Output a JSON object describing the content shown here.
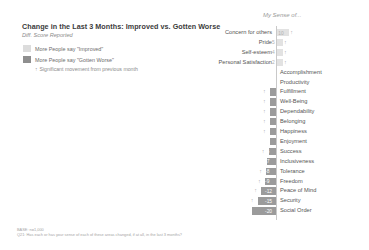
{
  "header": {
    "title": "Change in the Last 3 Months: Improved vs. Gotten Worse",
    "subtitle": "Diff. Score Reported",
    "plot_header": "My Sense of..."
  },
  "legend": {
    "items": [
      {
        "swatch": "light",
        "label": "More People say \"Improved\""
      },
      {
        "swatch": "dark",
        "label": "More People say \"Gotten Worse\""
      }
    ],
    "note": "Significant movement from previous month",
    "note_marker": "↑"
  },
  "footnote": {
    "line1": "BASE: n=1,000",
    "line2": "Q21: Has each or has your sense of each of these areas changed, if at all, in the last 3 months?"
  },
  "colors": {
    "improved": "#e2e2e2",
    "worse": "#9b9b9b",
    "axis": "#c9c9c9",
    "text": "#555555",
    "muted": "#9a9a9a"
  },
  "chart_data": {
    "type": "bar",
    "orientation": "horizontal",
    "title": "Change in the Last 3 Months: Improved vs. Gotten Worse",
    "subtitle": "Diff. Score Reported",
    "xlabel": "",
    "ylabel": "My Sense of...",
    "xlim": [
      -30,
      12
    ],
    "grid": false,
    "legend_position": "top-left",
    "categories": [
      "Concern for others",
      "Pride",
      "Self-esteem",
      "Personal Satisfaction",
      "Accomplishment",
      "Productivity",
      "Fulfillment",
      "Well-Being",
      "Dependability",
      "Belonging",
      "Happiness",
      "Enjoyment",
      "Success",
      "Inclusiveness",
      "Tolerance",
      "Freedom",
      "Peace of Mind",
      "Security",
      "Social Order"
    ],
    "values": [
      10,
      5,
      4,
      2,
      0,
      0,
      -2,
      -2,
      -2,
      -3,
      -5,
      -4,
      -6,
      -7,
      -8,
      -9,
      -12,
      -15,
      -20
    ],
    "significant": [
      true,
      true,
      true,
      true,
      false,
      false,
      true,
      true,
      true,
      true,
      true,
      false,
      true,
      false,
      true,
      true,
      true,
      true,
      false
    ],
    "value_labels": [
      "10",
      "5",
      "4",
      "2",
      "",
      "",
      "-2",
      "-2",
      "-2",
      "-3",
      "-5",
      "-4",
      "-6",
      "-7",
      "-8",
      "-9",
      "-12",
      "-15",
      "-20"
    ]
  }
}
